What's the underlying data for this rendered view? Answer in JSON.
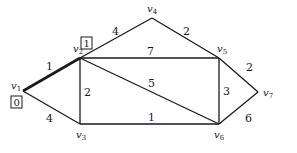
{
  "diagram": {
    "type": "weighted-graph",
    "nodes": [
      {
        "id": "v1",
        "name": "v",
        "sub": "1",
        "x": 23,
        "y": 91,
        "lx": 11,
        "ly": 89
      },
      {
        "id": "v2",
        "name": "v",
        "sub": "2",
        "x": 80,
        "y": 58,
        "lx": 73,
        "ly": 52
      },
      {
        "id": "v3",
        "name": "v",
        "sub": "3",
        "x": 80,
        "y": 124,
        "lx": 76,
        "ly": 138
      },
      {
        "id": "v4",
        "name": "v",
        "sub": "4",
        "x": 152,
        "y": 18,
        "lx": 147,
        "ly": 12
      },
      {
        "id": "v5",
        "name": "v",
        "sub": "5",
        "x": 219,
        "y": 58,
        "lx": 217,
        "ly": 52
      },
      {
        "id": "v6",
        "name": "v",
        "sub": "6",
        "x": 219,
        "y": 124,
        "lx": 214,
        "ly": 138
      },
      {
        "id": "v7",
        "name": "v",
        "sub": "7",
        "x": 258,
        "y": 92,
        "lx": 263,
        "ly": 96
      }
    ],
    "edges": [
      {
        "from": "v1",
        "to": "v2",
        "weight": "1",
        "bold": true,
        "lx": 46,
        "ly": 70
      },
      {
        "from": "v1",
        "to": "v3",
        "weight": "4",
        "bold": false,
        "lx": 46,
        "ly": 122
      },
      {
        "from": "v2",
        "to": "v3",
        "weight": "2",
        "bold": false,
        "lx": 84,
        "ly": 96
      },
      {
        "from": "v2",
        "to": "v4",
        "weight": "4",
        "bold": false,
        "lx": 112,
        "ly": 35
      },
      {
        "from": "v2",
        "to": "v5",
        "weight": "7",
        "bold": false,
        "lx": 147,
        "ly": 55
      },
      {
        "from": "v2",
        "to": "v6",
        "weight": "5",
        "bold": false,
        "lx": 148,
        "ly": 87
      },
      {
        "from": "v3",
        "to": "v6",
        "weight": "1",
        "bold": false,
        "lx": 148,
        "ly": 121
      },
      {
        "from": "v4",
        "to": "v5",
        "weight": "2",
        "bold": false,
        "lx": 183,
        "ly": 35
      },
      {
        "from": "v5",
        "to": "v6",
        "weight": "3",
        "bold": false,
        "lx": 223,
        "ly": 95
      },
      {
        "from": "v5",
        "to": "v7",
        "weight": "2",
        "bold": false,
        "lx": 246,
        "ly": 71
      },
      {
        "from": "v6",
        "to": "v7",
        "weight": "6",
        "bold": false,
        "lx": 245,
        "ly": 122
      }
    ],
    "labels_boxed": [
      {
        "node": "v2",
        "text": "1",
        "x": 81,
        "y": 37
      },
      {
        "node": "v1",
        "text": "0",
        "x": 11,
        "y": 96
      }
    ]
  }
}
